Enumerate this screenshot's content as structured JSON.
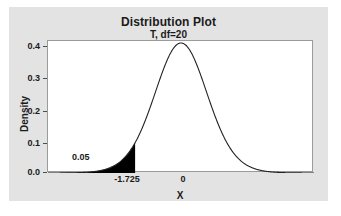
{
  "chart_data": {
    "type": "line",
    "title": "Distribution Plot",
    "subtitle": "T, df=20",
    "xlabel": "X",
    "ylabel": "Density",
    "distribution": "T",
    "df": 20,
    "xlim": [
      -5.0,
      5.0
    ],
    "ylim": [
      0.0,
      0.4
    ],
    "grid": false,
    "legend": false,
    "yticks": [
      "0.0",
      "0.1",
      "0.2",
      "0.3",
      "0.4"
    ],
    "ytick_values": [
      0.0,
      0.1,
      0.2,
      0.3,
      0.4
    ],
    "xticks": [
      "-1.725",
      "0"
    ],
    "xtick_values": [
      -1.725,
      0
    ],
    "peak_density": 0.394,
    "shaded_region": {
      "label": "0.05",
      "area": 0.05,
      "from": -5.0,
      "to": -1.725,
      "tail": "left",
      "color": "#000000"
    },
    "curve_color": "#222222",
    "x": [
      -5.0,
      -4.8,
      -4.6,
      -4.4,
      -4.2,
      -4.0,
      -3.8,
      -3.6,
      -3.4,
      -3.2,
      -3.0,
      -2.8,
      -2.6,
      -2.4,
      -2.2,
      -2.0,
      -1.8,
      -1.725,
      -1.6,
      -1.4,
      -1.2,
      -1.0,
      -0.8,
      -0.6,
      -0.4,
      -0.2,
      0.0,
      0.2,
      0.4,
      0.6,
      0.8,
      1.0,
      1.2,
      1.4,
      1.6,
      1.8,
      2.0,
      2.2,
      2.4,
      2.6,
      2.8,
      3.0,
      3.2,
      3.4,
      3.6,
      3.8,
      4.0,
      4.2,
      4.4,
      4.6,
      4.8,
      5.0
    ],
    "y": [
      0.0005,
      0.0007,
      0.0009,
      0.0013,
      0.0017,
      0.0023,
      0.0032,
      0.0044,
      0.006,
      0.0082,
      0.0114,
      0.0157,
      0.0217,
      0.0299,
      0.0411,
      0.056,
      0.0754,
      0.0838,
      0.0999,
      0.1293,
      0.1633,
      0.2008,
      0.2399,
      0.2777,
      0.311,
      0.3366,
      0.394,
      0.3366,
      0.311,
      0.2777,
      0.2399,
      0.2008,
      0.1633,
      0.1293,
      0.0999,
      0.0754,
      0.056,
      0.0411,
      0.0299,
      0.0217,
      0.0157,
      0.0114,
      0.0082,
      0.006,
      0.0044,
      0.0032,
      0.0023,
      0.0017,
      0.0013,
      0.0009,
      0.0007,
      0.0005
    ]
  },
  "figure": {
    "panel_color": "#e3e3e3",
    "plot_background": "#ffffff",
    "border_color": "#9a9a9a"
  }
}
